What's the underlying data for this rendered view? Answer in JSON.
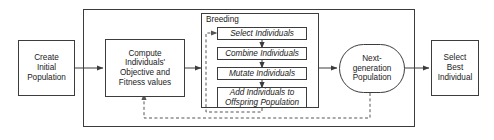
{
  "diagram": {
    "colors": {
      "stroke": "#3c3c3c",
      "text": "#1a1a1a",
      "background": "#ffffff",
      "dashed_stroke": "#555555"
    },
    "nodes": {
      "create_initial_population": {
        "label": "Create Initial Population",
        "lines": [
          "Create",
          "Initial",
          "Population"
        ]
      },
      "compute_fitness": {
        "label": "Compute Individuals' Objective and Fitness values",
        "lines": [
          "Compute",
          "Individuals'",
          "Objective and",
          "Fitness values"
        ]
      },
      "next_generation_population": {
        "label": "Next-generation Population",
        "lines": [
          "Next-",
          "generation",
          "Population"
        ]
      },
      "select_best_individual": {
        "label": "Select Best Individual",
        "lines": [
          "Select",
          "Best",
          "Individual"
        ]
      }
    },
    "breeding": {
      "title": "Breeding",
      "steps": [
        {
          "id": "select-individuals",
          "lines": [
            "Select Individuals"
          ]
        },
        {
          "id": "combine-individuals",
          "lines": [
            "Combine Individuals"
          ]
        },
        {
          "id": "mutate-individuals",
          "lines": [
            "Mutate Individuals"
          ]
        },
        {
          "id": "add-individuals",
          "lines": [
            "Add Individuals to",
            "Offspring Population"
          ]
        }
      ]
    },
    "connections": [
      {
        "id": "create-to-compute",
        "style": "solid",
        "label": ""
      },
      {
        "id": "compute-to-breeding",
        "style": "solid",
        "label": ""
      },
      {
        "id": "breeding-to-nextgen",
        "style": "solid",
        "label": ""
      },
      {
        "id": "nextgen-to-select-best",
        "style": "solid",
        "label": ""
      },
      {
        "id": "select-to-combine",
        "style": "solid",
        "label": ""
      },
      {
        "id": "combine-to-mutate",
        "style": "solid",
        "label": ""
      },
      {
        "id": "mutate-to-add",
        "style": "solid",
        "label": ""
      },
      {
        "id": "offspring-loop-to-select",
        "style": "dashed",
        "label": ""
      },
      {
        "id": "nextgen-feedback-to-compute",
        "style": "dashed",
        "label": ""
      }
    ]
  }
}
